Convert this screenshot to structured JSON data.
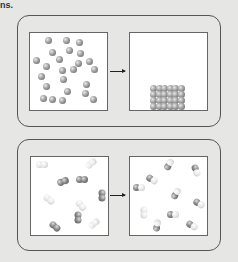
{
  "page": {
    "fragment_text": "ns."
  },
  "top_panel": {
    "description": "Gas particles condense into an ordered solid",
    "left_box": {
      "label": "Randomly dispersed gray spheres",
      "particle_count": 24
    },
    "arrow": "right-arrow",
    "right_box": {
      "label": "Close-packed spheres stacked at bottom",
      "rows": 4,
      "columns": 6
    }
  },
  "bottom_panel": {
    "description": "Diatomic molecules (dark-dark and light-light) react to form mixed dark-light molecules",
    "left_box": {
      "label": "Homonuclear diatomic molecules",
      "dark_molecules": 5,
      "light_molecules": 5
    },
    "arrow": "right-arrow",
    "right_box": {
      "label": "Heteronuclear diatomic molecules",
      "mixed_molecules": 10
    }
  },
  "colors": {
    "background": "#e6e6e4",
    "box_fill": "#ffffff",
    "border": "#555555",
    "sphere_dark": "#7a7a7a",
    "sphere_light": "#e6e6e6"
  }
}
